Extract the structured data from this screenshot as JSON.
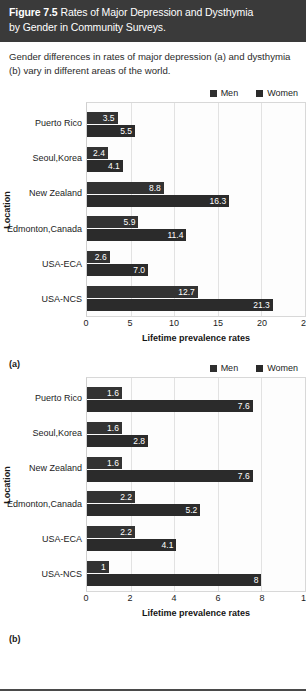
{
  "figure": {
    "number": "Figure 7.5",
    "title_line1": "Rates of Major Depression and Dysthymia",
    "title_line2": "by Gender in Community Surveys.",
    "caption": "Gender differences in rates of major depression (a) and dysthymia (b) vary in different areas of the world.",
    "header_bg": "#3a3a3a",
    "header_fg": "#ffffff"
  },
  "legend": {
    "men_label": "Men",
    "women_label": "Women",
    "men_color": "#333333",
    "women_color": "#2b2b2b"
  },
  "panels": {
    "a_label": "(a)",
    "b_label": "(b)"
  },
  "chart_data": [
    {
      "type": "bar",
      "orientation": "horizontal",
      "panel": "(a)",
      "title": "Rates of Major Depression by Gender in Community Surveys",
      "xlabel": "Lifetime prevalence rates",
      "ylabel": "Location",
      "xlim": [
        0,
        25
      ],
      "xticks": [
        0,
        5,
        10,
        15,
        20,
        25
      ],
      "xtick_labels": [
        "0",
        "5",
        "10",
        "15",
        "20",
        "25"
      ],
      "grid": true,
      "legend_position": "top-right",
      "categories": [
        "Puerto Rico",
        "Seoul, Korea",
        "New Zealand",
        "Edmonton, Canada",
        "USA-ECA",
        "USA-NCS"
      ],
      "series": [
        {
          "name": "Men",
          "values": [
            3.5,
            2.4,
            8.8,
            5.9,
            2.6,
            12.7
          ],
          "labels": [
            "3.5",
            "2.4",
            "8.8",
            "5.9",
            "2.6",
            "12.7"
          ]
        },
        {
          "name": "Women",
          "values": [
            5.5,
            4.1,
            16.3,
            11.4,
            7.0,
            21.3
          ],
          "labels": [
            "5.5",
            "4.1",
            "16.3",
            "11.4",
            "7.0",
            "21.3"
          ]
        }
      ]
    },
    {
      "type": "bar",
      "orientation": "horizontal",
      "panel": "(b)",
      "title": "Rates of Dysthymia by Gender in Community Surveys",
      "xlabel": "Lifetime prevalence rates",
      "ylabel": "Location",
      "xlim": [
        0,
        10
      ],
      "xticks": [
        0,
        2,
        4,
        6,
        8,
        10
      ],
      "xtick_labels": [
        "0",
        "2",
        "4",
        "6",
        "8",
        "10"
      ],
      "grid": true,
      "legend_position": "top-right",
      "categories": [
        "Puerto Rico",
        "Seoul, Korea",
        "New Zealand",
        "Edmonton, Canada",
        "USA-ECA",
        "USA-NCS"
      ],
      "series": [
        {
          "name": "Men",
          "values": [
            1.6,
            1.6,
            1.6,
            2.2,
            2.2,
            1.0
          ],
          "labels": [
            "1.6",
            "1.6",
            "1.6",
            "2.2",
            "2.2",
            "1"
          ]
        },
        {
          "name": "Women",
          "values": [
            7.6,
            2.8,
            7.6,
            5.2,
            4.1,
            8.0
          ],
          "labels": [
            "7.6",
            "2.8",
            "7.6",
            "5.2",
            "4.1",
            "8"
          ]
        }
      ]
    }
  ]
}
